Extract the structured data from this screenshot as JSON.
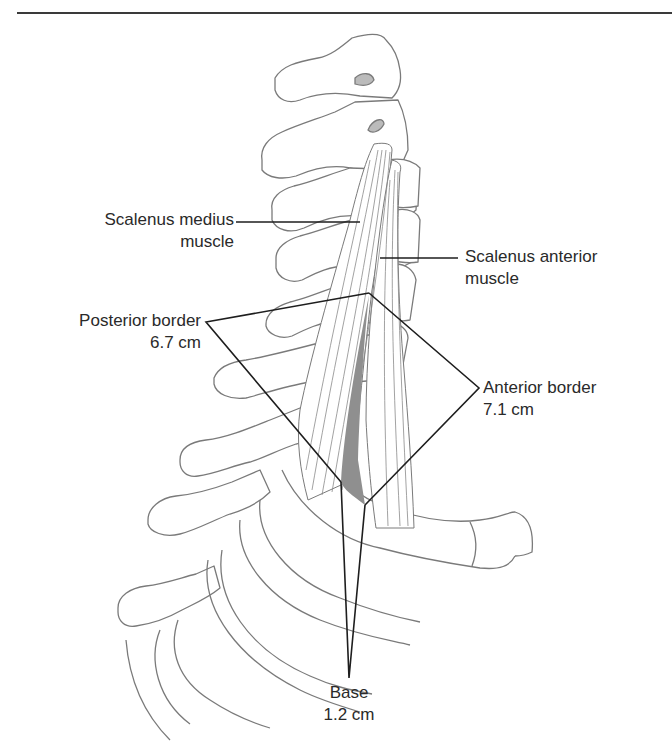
{
  "figure": {
    "labels": {
      "scalenus_medius": {
        "line1": "Scalenus medius",
        "line2": "muscle"
      },
      "scalenus_anterior": {
        "line1": "Scalenus anterior",
        "line2": "muscle"
      },
      "posterior_border": {
        "name": "Posterior border",
        "value": "6.7 cm"
      },
      "anterior_border": {
        "name": "Anterior border",
        "value": "7.1 cm"
      },
      "base": {
        "name": "Base",
        "value": "1.2 cm"
      }
    },
    "colors": {
      "line": "#1e1e1e",
      "bone_outline": "#7a7a7a",
      "triangle_fill": "#8f8f8f",
      "rule": "#3a3a3a"
    }
  }
}
